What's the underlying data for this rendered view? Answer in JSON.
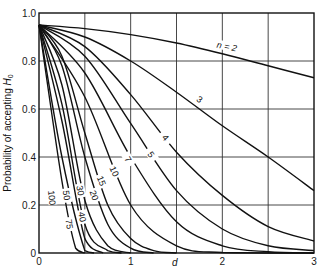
{
  "chart_data": {
    "type": "line",
    "title": "",
    "xlabel": "d",
    "ylabel": "Probability of accepting H0",
    "xlim": [
      0,
      3
    ],
    "ylim": [
      0,
      1.0
    ],
    "grid": true,
    "legend": "none (curves labeled inline with n values)",
    "x_ticks": [
      "0",
      "1",
      "2",
      "3"
    ],
    "y_ticks": [
      "0",
      "0.2",
      "0.4",
      "0.6",
      "0.8",
      "1.0"
    ],
    "series": [
      {
        "name": "n = 2",
        "label": "n = 2",
        "points": [
          [
            0,
            0.95
          ],
          [
            0.5,
            0.935
          ],
          [
            1,
            0.91
          ],
          [
            1.5,
            0.875
          ],
          [
            2,
            0.83
          ],
          [
            2.5,
            0.78
          ],
          [
            3,
            0.73
          ]
        ]
      },
      {
        "name": "3",
        "label": "3",
        "points": [
          [
            0,
            0.95
          ],
          [
            0.5,
            0.9
          ],
          [
            1,
            0.8
          ],
          [
            1.5,
            0.67
          ],
          [
            2,
            0.53
          ],
          [
            2.5,
            0.4
          ],
          [
            3,
            0.26
          ]
        ]
      },
      {
        "name": "4",
        "label": "4",
        "points": [
          [
            0,
            0.95
          ],
          [
            0.5,
            0.86
          ],
          [
            1,
            0.66
          ],
          [
            1.5,
            0.42
          ],
          [
            2,
            0.24
          ],
          [
            2.5,
            0.11
          ],
          [
            3,
            0.05
          ]
        ]
      },
      {
        "name": "5",
        "label": "5",
        "points": [
          [
            0,
            0.95
          ],
          [
            0.5,
            0.82
          ],
          [
            1,
            0.54
          ],
          [
            1.5,
            0.26
          ],
          [
            2,
            0.1
          ],
          [
            2.5,
            0.03
          ],
          [
            3,
            0.01
          ]
        ]
      },
      {
        "name": "7",
        "label": "7",
        "points": [
          [
            0,
            0.95
          ],
          [
            0.5,
            0.75
          ],
          [
            1,
            0.4
          ],
          [
            1.5,
            0.13
          ],
          [
            2,
            0.03
          ],
          [
            2.5,
            0.005
          ],
          [
            3,
            0
          ]
        ]
      },
      {
        "name": "10",
        "label": "10",
        "points": [
          [
            0,
            0.95
          ],
          [
            0.5,
            0.65
          ],
          [
            1,
            0.2
          ],
          [
            1.5,
            0.03
          ],
          [
            2,
            0.002
          ],
          [
            3,
            0
          ]
        ]
      },
      {
        "name": "15",
        "label": "15",
        "points": [
          [
            0,
            0.95
          ],
          [
            0.25,
            0.82
          ],
          [
            0.5,
            0.5
          ],
          [
            0.75,
            0.2
          ],
          [
            1,
            0.06
          ],
          [
            1.25,
            0.01
          ],
          [
            1.5,
            0
          ]
        ]
      },
      {
        "name": "20",
        "label": "20",
        "points": [
          [
            0,
            0.95
          ],
          [
            0.25,
            0.78
          ],
          [
            0.5,
            0.4
          ],
          [
            0.75,
            0.12
          ],
          [
            1,
            0.02
          ],
          [
            1.25,
            0
          ]
        ]
      },
      {
        "name": "30",
        "label": "30",
        "points": [
          [
            0,
            0.95
          ],
          [
            0.25,
            0.7
          ],
          [
            0.5,
            0.22
          ],
          [
            0.75,
            0.03
          ],
          [
            1,
            0
          ]
        ]
      },
      {
        "name": "40",
        "label": "40",
        "points": [
          [
            0,
            0.95
          ],
          [
            0.25,
            0.62
          ],
          [
            0.5,
            0.12
          ],
          [
            0.75,
            0.01
          ],
          [
            0.9,
            0
          ]
        ]
      },
      {
        "name": "50",
        "label": "50",
        "points": [
          [
            0,
            0.95
          ],
          [
            0.25,
            0.55
          ],
          [
            0.5,
            0.06
          ],
          [
            0.7,
            0
          ]
        ]
      },
      {
        "name": "75",
        "label": "75",
        "points": [
          [
            0,
            0.95
          ],
          [
            0.25,
            0.4
          ],
          [
            0.5,
            0.01
          ],
          [
            0.6,
            0
          ]
        ]
      },
      {
        "name": "100",
        "label": "100",
        "points": [
          [
            0,
            0.95
          ],
          [
            0.25,
            0.3
          ],
          [
            0.4,
            0.02
          ],
          [
            0.5,
            0
          ]
        ]
      }
    ],
    "label_positions": [
      {
        "text": "n = 2",
        "x": 2.05,
        "y": 0.86,
        "rot": 12
      },
      {
        "text": "3",
        "x": 1.75,
        "y": 0.64,
        "rot": 35
      },
      {
        "text": "4",
        "x": 1.38,
        "y": 0.48,
        "rot": 50
      },
      {
        "text": "5",
        "x": 1.22,
        "y": 0.41,
        "rot": 55
      },
      {
        "text": "7",
        "x": 0.97,
        "y": 0.39,
        "rot": 60
      },
      {
        "text": "10",
        "x": 0.82,
        "y": 0.34,
        "rot": 65
      },
      {
        "text": "15",
        "x": 0.68,
        "y": 0.3,
        "rot": 68
      },
      {
        "text": "20",
        "x": 0.6,
        "y": 0.24,
        "rot": 72
      },
      {
        "text": "30",
        "x": 0.45,
        "y": 0.26,
        "rot": 78
      },
      {
        "text": "40",
        "x": 0.47,
        "y": 0.15,
        "rot": 80
      },
      {
        "text": "50",
        "x": 0.3,
        "y": 0.24,
        "rot": 82
      },
      {
        "text": "75",
        "x": 0.33,
        "y": 0.12,
        "rot": 82
      },
      {
        "text": "100",
        "x": 0.14,
        "y": 0.23,
        "rot": 84
      }
    ]
  },
  "axes": {
    "y_label_main": "Probability of accepting ",
    "y_label_sym": "H",
    "y_label_sub": "0",
    "x_label": "d"
  }
}
